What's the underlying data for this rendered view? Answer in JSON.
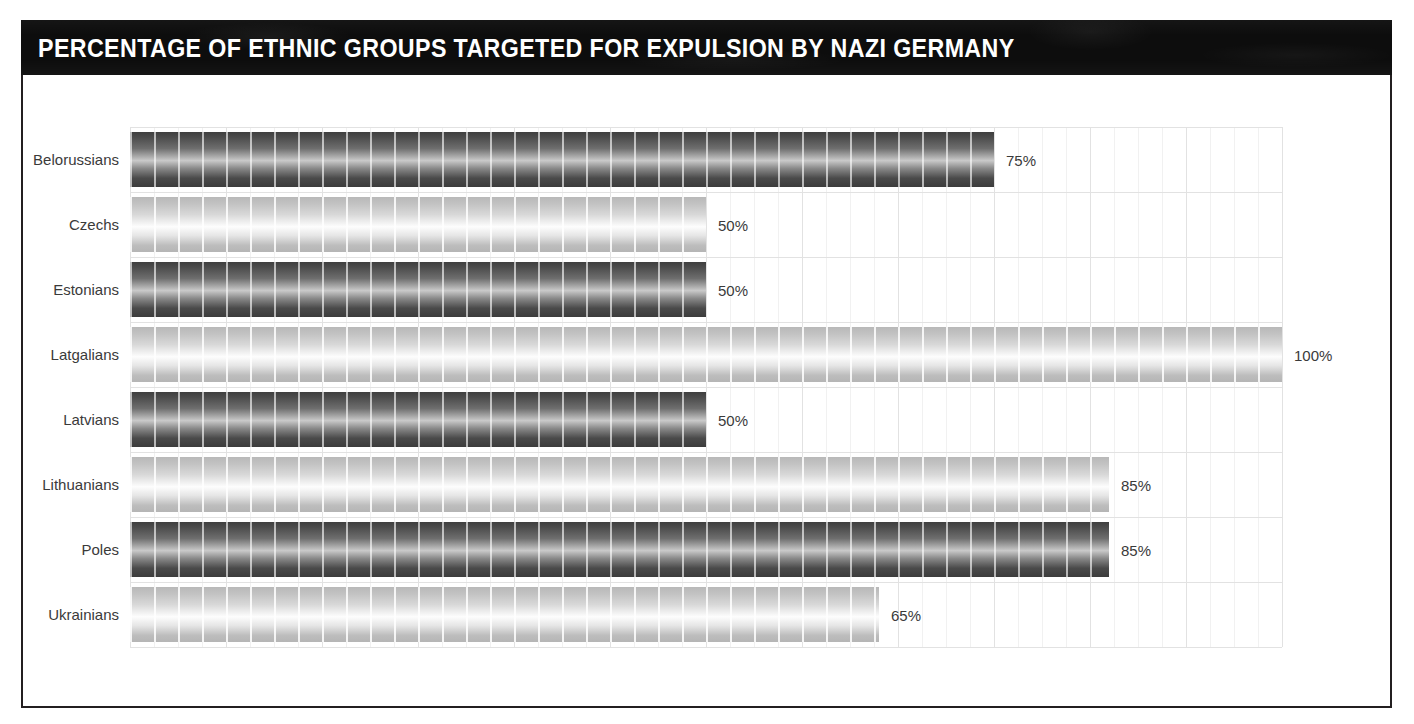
{
  "header": {
    "title": "PERCENTAGE OF ETHNIC GROUPS TARGETED FOR EXPULSION BY NAZI GERMANY",
    "background_color": "#0d0d0d",
    "text_color": "#ffffff"
  },
  "chart_data": {
    "type": "bar",
    "orientation": "horizontal",
    "title": "PERCENTAGE OF ETHNIC GROUPS TARGETED FOR EXPULSION BY NAZI GERMANY",
    "xlabel": "",
    "ylabel": "",
    "xlim": [
      0,
      100
    ],
    "grid": true,
    "legend": "none",
    "value_suffix": "%",
    "categories": [
      "Belorussians",
      "Czechs",
      "Estonians",
      "Latgalians",
      "Latvians",
      "Lithuanians",
      "Poles",
      "Ukrainians"
    ],
    "values": [
      75,
      50,
      50,
      100,
      50,
      85,
      85,
      65
    ],
    "labels": [
      "75%",
      "50%",
      "50%",
      "100%",
      "50%",
      "85%",
      "85%",
      "65%"
    ],
    "bar_styles": [
      "dark",
      "light",
      "dark",
      "light",
      "dark",
      "light",
      "dark",
      "light"
    ],
    "bars": [
      {
        "category": "Belorussians",
        "value": 75,
        "label": "75%",
        "style": "dark"
      },
      {
        "category": "Czechs",
        "value": 50,
        "label": "50%",
        "style": "light"
      },
      {
        "category": "Estonians",
        "value": 50,
        "label": "50%",
        "style": "dark"
      },
      {
        "category": "Latgalians",
        "value": 100,
        "label": "100%",
        "style": "light"
      },
      {
        "category": "Latvians",
        "value": 50,
        "label": "50%",
        "style": "dark"
      },
      {
        "category": "Lithuanians",
        "value": 85,
        "label": "85%",
        "style": "light"
      },
      {
        "category": "Poles",
        "value": 85,
        "label": "85%",
        "style": "dark"
      },
      {
        "category": "Ukrainians",
        "value": 65,
        "label": "65%",
        "style": "light"
      }
    ],
    "colors": {
      "bar_dark": "#4a4a4a",
      "bar_light": "#d8d8d8",
      "gridline_major": "#e2e2e2",
      "gridline_minor": "#f1f1f1",
      "label_text": "#3a3a3a",
      "frame": "#231f20",
      "background": "#ffffff"
    }
  }
}
